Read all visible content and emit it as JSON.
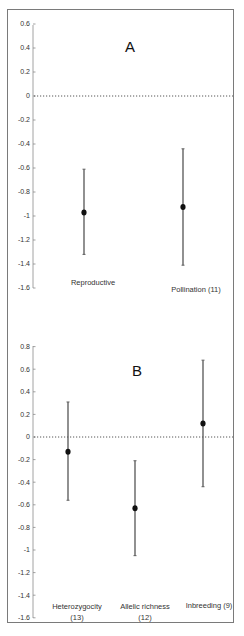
{
  "chart_data": [
    {
      "panel": "A",
      "type": "scatter",
      "title": "A",
      "xlabel": "",
      "ylabel": "",
      "ylim": [
        -1.6,
        0.6
      ],
      "yticks": [
        0.6,
        0.4,
        0.2,
        0,
        -0.2,
        -0.4,
        -0.6,
        -0.8,
        -1,
        -1.2,
        -1.4,
        -1.6
      ],
      "ytick_labels": [
        "0.6",
        "0.4",
        "0.2",
        "0",
        "-0.2",
        "-0.4",
        "-0.6",
        "-0.8",
        "-1",
        "-1.2",
        "-1.4",
        "-1.6"
      ],
      "reference_line": {
        "y": 0,
        "style": "dotted"
      },
      "grid": false,
      "legend": null,
      "categories": [
        "Reproductive",
        "Pollination (11)"
      ],
      "points": [
        {
          "label": "Reproductive",
          "value": -0.97,
          "lower": -1.32,
          "upper": -0.61
        },
        {
          "label": "Pollination (11)",
          "value": -0.925,
          "lower": -1.41,
          "upper": -0.44
        }
      ]
    },
    {
      "panel": "B",
      "type": "scatter",
      "title": "B",
      "xlabel": "",
      "ylabel": "",
      "ylim": [
        -1.6,
        0.8
      ],
      "yticks": [
        0.8,
        0.6,
        0.4,
        0.2,
        0,
        -0.2,
        -0.4,
        -0.6,
        -0.8,
        -1,
        -1.2,
        -1.4,
        -1.6
      ],
      "ytick_labels": [
        "0.8",
        "0.6",
        "0.4",
        "0.2",
        "0",
        "-0.2",
        "-0.4",
        "-0.6",
        "-0.8",
        "-1",
        "-1.2",
        "-1.4",
        "-1.6"
      ],
      "reference_line": {
        "y": 0,
        "style": "dotted"
      },
      "grid": false,
      "legend": null,
      "categories": [
        "Heterozygocity (13)",
        "Allelic richness (12)",
        "Inbreeding (9)"
      ],
      "points": [
        {
          "label": "Heterozygocity (13)",
          "value": -0.13,
          "lower": -0.56,
          "upper": 0.31
        },
        {
          "label": "Allelic richness (12)",
          "value": -0.63,
          "lower": -1.05,
          "upper": -0.21
        },
        {
          "label": "Inbreeding (9)",
          "value": 0.12,
          "lower": -0.44,
          "upper": 0.68
        }
      ]
    }
  ],
  "panels": {
    "a": {
      "label": "A",
      "cat1_line1": "Reproductive",
      "cat2_line1": "Pollination (11)"
    },
    "b": {
      "label": "B",
      "cat1_line1": "Heterozygocity",
      "cat1_line2": "(13)",
      "cat2_line1": "Allelic richness",
      "cat2_line2": "(12)",
      "cat3_line1": "Inbreeding (9)"
    }
  },
  "colors": {
    "frame": "#7a7a7a",
    "axis": "#8a8a8a",
    "errorbar": "#555555",
    "point": "#111111",
    "reference": "#444444"
  }
}
